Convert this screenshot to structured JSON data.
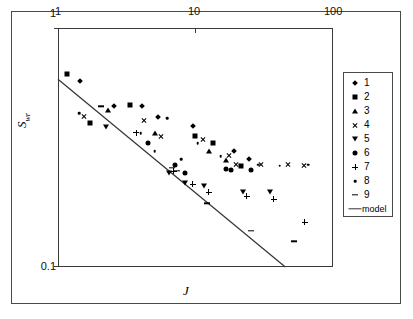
{
  "chart_data": {
    "type": "scatter",
    "title": "",
    "xlabel": "J",
    "ylabel": "Swr",
    "ylabel_base": "S",
    "ylabel_sub": "wr",
    "xscale": "log",
    "yscale": "log",
    "xlim": [
      1,
      100
    ],
    "ylim": [
      0.1,
      1
    ],
    "xticks": [
      1,
      10,
      100
    ],
    "xtick_labels": [
      "1",
      "10",
      "100"
    ],
    "yticks": [
      0.1,
      1
    ],
    "ytick_labels": [
      "0.1",
      "1"
    ],
    "xaxis_position": "top",
    "grid": false,
    "legend_position": "right-outside",
    "series": [
      {
        "name": "1",
        "marker": "diamond",
        "points": [
          {
            "x": 1.45,
            "y": 0.6
          },
          {
            "x": 2.55,
            "y": 0.47
          },
          {
            "x": 4.1,
            "y": 0.47
          },
          {
            "x": 5.35,
            "y": 0.425
          },
          {
            "x": 9.6,
            "y": 0.39
          },
          {
            "x": 19.0,
            "y": 0.305
          },
          {
            "x": 24.5,
            "y": 0.282
          }
        ]
      },
      {
        "name": "2",
        "marker": "square",
        "points": [
          {
            "x": 1.17,
            "y": 0.64
          },
          {
            "x": 1.7,
            "y": 0.4
          },
          {
            "x": 3.35,
            "y": 0.475
          },
          {
            "x": 9.85,
            "y": 0.352
          },
          {
            "x": 13.4,
            "y": 0.33
          },
          {
            "x": 21.5,
            "y": 0.265
          }
        ]
      },
      {
        "name": "3",
        "marker": "triangle",
        "points": [
          {
            "x": 2.3,
            "y": 0.455
          },
          {
            "x": 5.1,
            "y": 0.362
          },
          {
            "x": 12.6,
            "y": 0.305
          },
          {
            "x": 16.8,
            "y": 0.28
          }
        ]
      },
      {
        "name": "4",
        "marker": "x",
        "points": [
          {
            "x": 1.55,
            "y": 0.425
          },
          {
            "x": 4.25,
            "y": 0.41
          },
          {
            "x": 5.6,
            "y": 0.352
          },
          {
            "x": 11.4,
            "y": 0.34
          },
          {
            "x": 17.4,
            "y": 0.292
          },
          {
            "x": 19.6,
            "y": 0.268
          },
          {
            "x": 30.0,
            "y": 0.268
          },
          {
            "x": 47.0,
            "y": 0.268
          },
          {
            "x": 62.0,
            "y": 0.265
          }
        ]
      },
      {
        "name": "5",
        "marker": "triangle-down",
        "points": [
          {
            "x": 2.25,
            "y": 0.385
          },
          {
            "x": 6.45,
            "y": 0.247
          },
          {
            "x": 8.35,
            "y": 0.225
          },
          {
            "x": 11.5,
            "y": 0.218
          },
          {
            "x": 22.0,
            "y": 0.205
          },
          {
            "x": 35.0,
            "y": 0.205
          }
        ]
      },
      {
        "name": "6",
        "marker": "circle",
        "points": [
          {
            "x": 4.55,
            "y": 0.33
          },
          {
            "x": 7.05,
            "y": 0.268
          },
          {
            "x": 8.45,
            "y": 0.247
          },
          {
            "x": 16.6,
            "y": 0.258
          },
          {
            "x": 18.2,
            "y": 0.255
          },
          {
            "x": 25.3,
            "y": 0.255
          }
        ]
      },
      {
        "name": "7",
        "marker": "cross",
        "points": [
          {
            "x": 3.7,
            "y": 0.365
          },
          {
            "x": 6.95,
            "y": 0.252
          },
          {
            "x": 9.55,
            "y": 0.222
          },
          {
            "x": 12.5,
            "y": 0.205
          },
          {
            "x": 23.5,
            "y": 0.198
          },
          {
            "x": 37.0,
            "y": 0.192
          },
          {
            "x": 62.5,
            "y": 0.154
          }
        ]
      },
      {
        "name": "8",
        "marker": "dot",
        "points": [
          {
            "x": 1.42,
            "y": 0.44
          },
          {
            "x": 4.0,
            "y": 0.362
          },
          {
            "x": 5.05,
            "y": 0.305
          },
          {
            "x": 6.2,
            "y": 0.42
          },
          {
            "x": 7.9,
            "y": 0.282
          },
          {
            "x": 10.4,
            "y": 0.33
          },
          {
            "x": 15.2,
            "y": 0.29
          },
          {
            "x": 21.0,
            "y": 0.268
          },
          {
            "x": 28.5,
            "y": 0.268
          },
          {
            "x": 41.0,
            "y": 0.265
          },
          {
            "x": 66.0,
            "y": 0.268
          }
        ]
      },
      {
        "name": "9",
        "marker": "dash",
        "points": [
          {
            "x": 2.05,
            "y": 0.47
          },
          {
            "x": 6.7,
            "y": 0.26
          },
          {
            "x": 7.3,
            "y": 0.252
          },
          {
            "x": 12.1,
            "y": 0.185
          },
          {
            "x": 25.5,
            "y": 0.142
          },
          {
            "x": 52.0,
            "y": 0.128
          }
        ]
      }
    ],
    "model": {
      "name": "model",
      "type": "line",
      "x_start": 1.0,
      "y_start": 0.61,
      "x_end": 45.0,
      "y_end": 0.1,
      "color": "#333333"
    },
    "legend_entries": [
      {
        "label": "1",
        "marker": "diamond"
      },
      {
        "label": "2",
        "marker": "square"
      },
      {
        "label": "3",
        "marker": "triangle"
      },
      {
        "label": "4",
        "marker": "x"
      },
      {
        "label": "5",
        "marker": "triangle-down"
      },
      {
        "label": "6",
        "marker": "circle"
      },
      {
        "label": "7",
        "marker": "cross"
      },
      {
        "label": "8",
        "marker": "dot"
      },
      {
        "label": "9",
        "marker": "dash"
      },
      {
        "label": "model",
        "marker": "line"
      }
    ]
  },
  "axes": {
    "y_top_label": "1",
    "y_bottom_label": "0.1",
    "x_labels": [
      "1",
      "10",
      "100"
    ],
    "x_title": "J",
    "y_title_base": "S",
    "y_title_sub": "wr"
  }
}
